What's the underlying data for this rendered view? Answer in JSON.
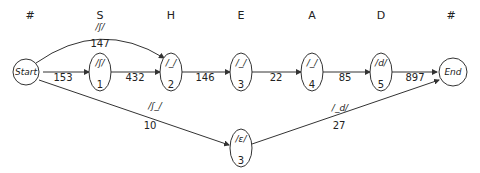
{
  "columns": [
    "#",
    "S",
    "H",
    "E",
    "A",
    "D",
    "#"
  ],
  "nodes": {
    "start": {
      "label": "Start"
    },
    "end": {
      "label": "End"
    },
    "n1": {
      "symbol": "/ʃ/",
      "index": "1"
    },
    "n2": {
      "symbol": "/_/",
      "index": "2"
    },
    "n3": {
      "symbol": "/_/",
      "index": "3"
    },
    "n4": {
      "symbol": "/_/",
      "index": "4"
    },
    "n5": {
      "symbol": "/d/",
      "index": "5"
    },
    "n6": {
      "symbol": "/ε/",
      "index": "3"
    }
  },
  "edges": {
    "start_n1": "153",
    "n1_n2": "432",
    "n2_n3": "146",
    "n3_n4": "22",
    "n4_n5": "85",
    "n5_end": "897",
    "arc_top": {
      "symbol": "/ʃ/",
      "weight": "147"
    },
    "start_n6": {
      "symbol": "/ʃ_/",
      "weight": "10"
    },
    "n6_end": {
      "symbol": "/_d/",
      "weight": "27"
    }
  }
}
